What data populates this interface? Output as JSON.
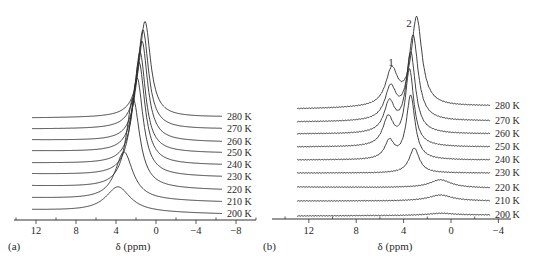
{
  "chart_data": [
    {
      "type": "line",
      "panel_label": "(a)",
      "title": "",
      "xlabel": "δ (ppm)",
      "ylabel": "",
      "x_reversed": true,
      "xlim": [
        14.2,
        -10
      ],
      "xticks": [
        12,
        8,
        4,
        0,
        -4,
        -8
      ],
      "xtick_labels": [
        "12",
        "8",
        "4",
        "0",
        "−4",
        "−8"
      ],
      "trace_range_ppm": [
        12.4,
        -6.6
      ],
      "legend_position": "right, labels at end of each stacked trace",
      "grid": false,
      "series": [
        {
          "name": "200 K",
          "baseline_left": 210,
          "baseline_right": 214,
          "peaks": [
            {
              "ppm": 3.8,
              "height_px": 25,
              "width": 2.2
            }
          ]
        },
        {
          "name": "210 K",
          "baseline_left": 198,
          "baseline_right": 202,
          "peaks": [
            {
              "ppm": 3.2,
              "height_px": 48,
              "width": 1.6
            }
          ]
        },
        {
          "name": "220 K",
          "baseline_left": 186,
          "baseline_right": 190,
          "peaks": [
            {
              "ppm": 2.3,
              "height_px": 90,
              "width": 1.2
            }
          ]
        },
        {
          "name": "230 K",
          "baseline_left": 174,
          "baseline_right": 177,
          "peaks": [
            {
              "ppm": 1.9,
              "height_px": 98,
              "width": 1.1
            }
          ]
        },
        {
          "name": "240 K",
          "baseline_left": 163,
          "baseline_right": 165,
          "peaks": [
            {
              "ppm": 1.7,
              "height_px": 102,
              "width": 1.05
            }
          ]
        },
        {
          "name": "250 K",
          "baseline_left": 151,
          "baseline_right": 153,
          "peaks": [
            {
              "ppm": 1.6,
              "height_px": 100,
              "width": 1.0
            }
          ]
        },
        {
          "name": "260 K",
          "baseline_left": 140,
          "baseline_right": 142,
          "peaks": [
            {
              "ppm": 1.4,
              "height_px": 100,
              "width": 1.0
            }
          ]
        },
        {
          "name": "270 K",
          "baseline_left": 129,
          "baseline_right": 129,
          "peaks": [
            {
              "ppm": 1.3,
              "height_px": 99,
              "width": 1.0
            }
          ]
        },
        {
          "name": "280 K",
          "baseline_left": 118,
          "baseline_right": 117,
          "peaks": [
            {
              "ppm": 1.1,
              "height_px": 96,
              "width": 1.0
            }
          ]
        }
      ]
    },
    {
      "type": "line",
      "panel_label": "(b)",
      "title": "",
      "xlabel": "δ (ppm)",
      "ylabel": "",
      "x_reversed": true,
      "xlim": [
        14.4,
        -5
      ],
      "xticks": [
        12,
        8,
        4,
        0,
        -4
      ],
      "xtick_labels": [
        "12",
        "8",
        "4",
        "0",
        "−4"
      ],
      "trace_range_ppm": [
        13,
        -3.3
      ],
      "legend_position": "right, labels at end of each stacked trace",
      "grid": false,
      "annotations": [
        {
          "text": "1",
          "ppm": 4.9,
          "note": "peak 1 (shoulder near 5 ppm)"
        },
        {
          "text": "2",
          "ppm": 3.6,
          "note": "peak 2 (main peak near 3 ppm)"
        }
      ],
      "series": [
        {
          "name": "200 K",
          "baseline_left": 216,
          "baseline_right": 215,
          "peaks": [
            {
              "ppm": 0.8,
              "height_px": 2,
              "width": 2.0
            }
          ]
        },
        {
          "name": "210 K",
          "baseline_left": 201,
          "baseline_right": 201,
          "peaks": [
            {
              "ppm": 0.9,
              "height_px": 6,
              "width": 1.8
            }
          ]
        },
        {
          "name": "220 K",
          "baseline_left": 187,
          "baseline_right": 188,
          "peaks": [
            {
              "ppm": 0.9,
              "height_px": 8,
              "width": 1.6
            }
          ]
        },
        {
          "name": "230 K",
          "baseline_left": 173,
          "baseline_right": 173,
          "peaks": [
            {
              "ppm": 3.1,
              "height_px": 25,
              "width": 0.75
            }
          ]
        },
        {
          "name": "240 K",
          "baseline_left": 160,
          "baseline_right": 160,
          "peaks": [
            {
              "ppm": 3.4,
              "height_px": 64,
              "width": 0.65
            },
            {
              "ppm": 5.2,
              "height_px": 18,
              "width": 0.7
            }
          ]
        },
        {
          "name": "250 K",
          "baseline_left": 147,
          "baseline_right": 147,
          "peaks": [
            {
              "ppm": 3.5,
              "height_px": 76,
              "width": 0.65
            },
            {
              "ppm": 5.3,
              "height_px": 28,
              "width": 0.8
            }
          ]
        },
        {
          "name": "260 K",
          "baseline_left": 134,
          "baseline_right": 134,
          "peaks": [
            {
              "ppm": 3.4,
              "height_px": 80,
              "width": 0.7
            },
            {
              "ppm": 5.2,
              "height_px": 30,
              "width": 0.8
            }
          ]
        },
        {
          "name": "270 K",
          "baseline_left": 122,
          "baseline_right": 121,
          "peaks": [
            {
              "ppm": 3.2,
              "height_px": 84,
              "width": 0.75
            },
            {
              "ppm": 5.1,
              "height_px": 32,
              "width": 0.85
            }
          ]
        },
        {
          "name": "280 K",
          "baseline_left": 109,
          "baseline_right": 106,
          "peaks": [
            {
              "ppm": 2.9,
              "height_px": 88,
              "width": 0.8
            },
            {
              "ppm": 5.0,
              "height_px": 36,
              "width": 0.9
            }
          ]
        }
      ]
    }
  ]
}
